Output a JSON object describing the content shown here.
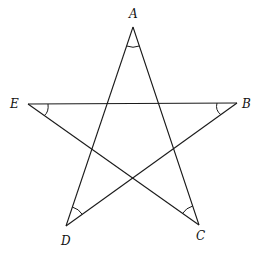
{
  "diagram": {
    "vertices": [
      {
        "label": "A",
        "x": 133,
        "y": 27
      },
      {
        "label": "B",
        "x": 237,
        "y": 103
      },
      {
        "label": "C",
        "x": 199,
        "y": 225
      },
      {
        "label": "D",
        "x": 66,
        "y": 226
      },
      {
        "label": "E",
        "x": 28,
        "y": 104
      }
    ],
    "edges": [
      [
        "A",
        "C"
      ],
      [
        "A",
        "D"
      ],
      [
        "E",
        "B"
      ],
      [
        "E",
        "C"
      ],
      [
        "B",
        "D"
      ]
    ],
    "angle_marks": [
      "A",
      "B",
      "C",
      "D",
      "E"
    ]
  }
}
